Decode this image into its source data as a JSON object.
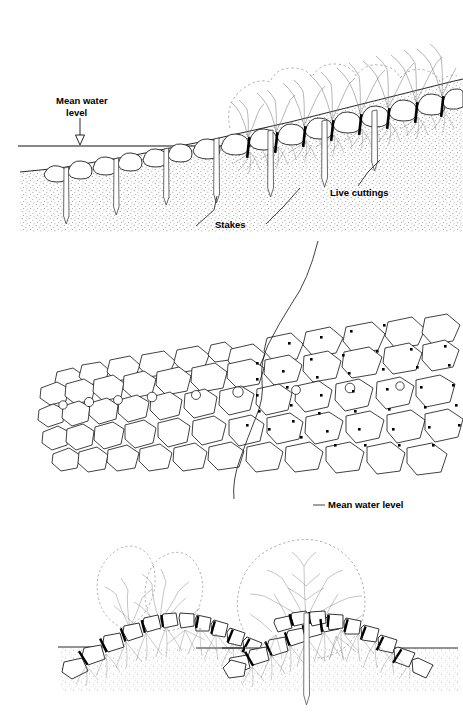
{
  "figure": {
    "background_color": "#ffffff",
    "line_color": "#000000",
    "stipple_color": "#7a7a7a",
    "root_color": "#6b6b6b",
    "canopy_color": "#8a8a8a"
  },
  "panels": {
    "top": {
      "name": "profile-view",
      "labels": {
        "mean_water_level_line1": "Mean water",
        "mean_water_level_line2": "level",
        "stakes": "Stakes",
        "live_cuttings": "Live cuttings"
      }
    },
    "middle": {
      "name": "plan-view",
      "labels": {
        "mean_water_level": "Mean water level"
      }
    },
    "bottom": {
      "name": "section-details",
      "left": {
        "name": "section-detail-left"
      },
      "right": {
        "name": "section-detail-right"
      }
    }
  }
}
